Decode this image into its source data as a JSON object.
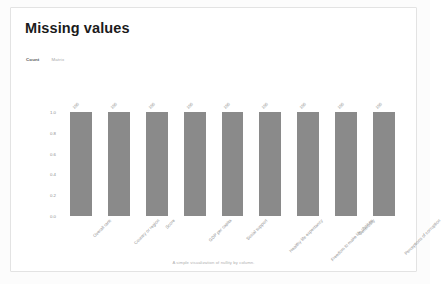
{
  "card": {
    "title": "Missing values",
    "caption": "A simple visualization of nullity by column."
  },
  "tabs": [
    {
      "label": "Count",
      "active": true
    },
    {
      "label": "Matrix",
      "active": false
    }
  ],
  "colors": {
    "bar": "#8a8a8a",
    "card_border": "#e3e3e3",
    "card_background": "#ffffff",
    "page_background": "#fcfcfc",
    "tick_text": "#8e8e8e",
    "title_text": "#1b1b1b",
    "caption_text": "#b0b0b0"
  },
  "chart_data": {
    "type": "bar",
    "title": "Missing values",
    "xlabel": "",
    "ylabel": "",
    "ylim": [
      0,
      1.0
    ],
    "grid": false,
    "legend": "none",
    "ytick_labels": [
      "1.0",
      "0.8",
      "0.6",
      "0.4",
      "0.2",
      "0.0"
    ],
    "ytick_values": [
      1.0,
      0.8,
      0.6,
      0.4,
      0.2,
      0.0
    ],
    "categories": [
      "Overall rank",
      "Country or region",
      "Score",
      "GDP per capita",
      "Social support",
      "Healthy life expectancy",
      "Freedom to make life choices",
      "Generosity",
      "Perceptions of corruption"
    ],
    "values": [
      1.0,
      1.0,
      1.0,
      1.0,
      1.0,
      1.0,
      1.0,
      1.0,
      1.0
    ],
    "bar_labels": [
      "156",
      "156",
      "156",
      "156",
      "156",
      "156",
      "156",
      "156",
      "156"
    ]
  }
}
